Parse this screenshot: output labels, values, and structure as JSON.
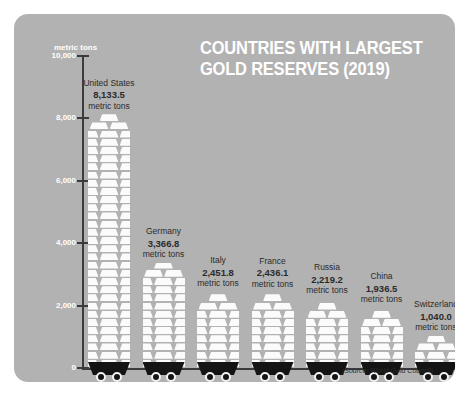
{
  "title_lines": [
    "COUNTRIES WITH LARGEST",
    "GOLD RESERVES (2019)"
  ],
  "axis_unit_label": "metric tons",
  "source_note": "(Source: World Gold Council)",
  "unit_suffix": "metric tons",
  "colors": {
    "panel_background": "#b2b2b2",
    "page_background": "#ffffff",
    "title_text": "#ffffff",
    "axis_line": "#3b3b3b",
    "axis_tick_text": "#ffffff",
    "label_text": "#2b2b2b",
    "ingot_fill": "#fbfbfb",
    "cart_fill": "#141414",
    "wheel_rim": "#f2f2f2"
  },
  "chart_data": {
    "type": "bar",
    "title": "COUNTRIES WITH LARGEST GOLD RESERVES (2019)",
    "xlabel": "",
    "ylabel": "metric tons",
    "ylim": [
      0,
      10000
    ],
    "yticks": [
      0,
      2000,
      4000,
      6000,
      8000,
      10000
    ],
    "ytick_labels": [
      "0",
      "2,000",
      "4,000",
      "6,000",
      "8,000",
      "10,000"
    ],
    "grid": false,
    "legend": false,
    "source": "World Gold Council",
    "categories": [
      "United States",
      "Germany",
      "Italy",
      "France",
      "Russia",
      "China",
      "Switzerland"
    ],
    "values": [
      8133.5,
      3366.8,
      2451.8,
      2436.1,
      2219.2,
      1936.5,
      1040.0
    ],
    "value_labels": [
      "8,133.5",
      "3,366.8",
      "2,451.8",
      "2,436.1",
      "2,219.2",
      "1,936.5",
      "1,040.0"
    ]
  },
  "bars": [
    {
      "country": "United States",
      "value_label": "8,133.5",
      "unit": "metric tons"
    },
    {
      "country": "Germany",
      "value_label": "3,366.8",
      "unit": "metric tons"
    },
    {
      "country": "Italy",
      "value_label": "2,451.8",
      "unit": "metric tons"
    },
    {
      "country": "France",
      "value_label": "2,436.1",
      "unit": "metric tons"
    },
    {
      "country": "Russia",
      "value_label": "2,219.2",
      "unit": "metric tons"
    },
    {
      "country": "China",
      "value_label": "1,936.5",
      "unit": "metric tons"
    },
    {
      "country": "Switzerland",
      "value_label": "1,040.0",
      "unit": "metric tons"
    }
  ]
}
